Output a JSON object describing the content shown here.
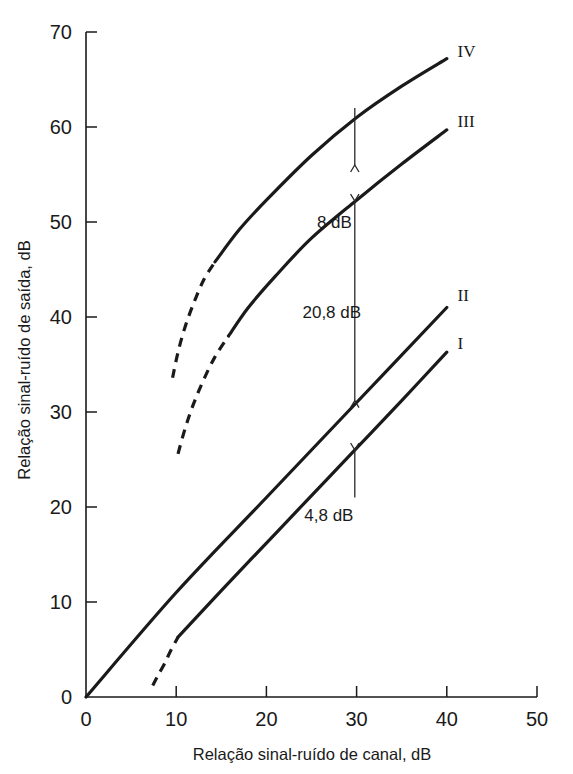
{
  "chart_data": {
    "type": "line",
    "title": "",
    "xlabel": "Relação sinal-ruído de canal, dB",
    "ylabel": "Relação sinal-ruído de saída, dB",
    "xlim": [
      0,
      50
    ],
    "ylim": [
      0,
      70
    ],
    "xticks": [
      0,
      10,
      20,
      30,
      40,
      50
    ],
    "yticks": [
      0,
      10,
      20,
      30,
      40,
      50,
      60,
      70
    ],
    "xtick_labels": [
      "0",
      "10",
      "20",
      "30",
      "40",
      "50"
    ],
    "ytick_labels": [
      "0",
      "10",
      "20",
      "30",
      "40",
      "50",
      "60",
      "70"
    ],
    "grid": false,
    "legend": "curve-end labels",
    "series": [
      {
        "name": "I",
        "label": "I",
        "label_x": 41.2,
        "label_y": 37.3,
        "solid_points": [
          [
            10.2,
            6.3
          ],
          [
            15.0,
            11.2
          ],
          [
            20.0,
            16.2
          ],
          [
            25.0,
            21.2
          ],
          [
            30.0,
            26.2
          ],
          [
            35.0,
            31.2
          ],
          [
            40.0,
            36.3
          ]
        ],
        "dashed_points": [
          [
            7.4,
            1.2
          ],
          [
            8.0,
            2.3
          ],
          [
            8.7,
            3.5
          ],
          [
            9.4,
            4.9
          ],
          [
            10.2,
            6.3
          ]
        ]
      },
      {
        "name": "II",
        "label": "II",
        "label_x": 41.2,
        "label_y": 42.3,
        "solid_points": [
          [
            0.0,
            0.0
          ],
          [
            10.0,
            11.0
          ],
          [
            20.0,
            21.0
          ],
          [
            30.0,
            31.0
          ],
          [
            40.0,
            41.0
          ]
        ],
        "dashed_points": []
      },
      {
        "name": "III",
        "label": "III",
        "label_x": 41.2,
        "label_y": 60.6,
        "solid_points": [
          [
            15.8,
            38.0
          ],
          [
            18.0,
            41.0
          ],
          [
            21.0,
            44.3
          ],
          [
            25.0,
            48.3
          ],
          [
            30.0,
            52.3
          ],
          [
            35.0,
            56.1
          ],
          [
            40.0,
            59.7
          ]
        ],
        "dashed_points": [
          [
            10.2,
            25.6
          ],
          [
            11.0,
            28.3
          ],
          [
            11.9,
            30.8
          ],
          [
            13.0,
            33.3
          ],
          [
            14.3,
            35.8
          ],
          [
            15.8,
            38.0
          ]
        ]
      },
      {
        "name": "IV",
        "label": "IV",
        "label_x": 41.2,
        "label_y": 68.0,
        "solid_points": [
          [
            14.3,
            45.8
          ],
          [
            17.0,
            49.2
          ],
          [
            20.0,
            52.3
          ],
          [
            25.0,
            57.0
          ],
          [
            30.0,
            61.0
          ],
          [
            35.0,
            64.3
          ],
          [
            40.0,
            67.2
          ]
        ],
        "dashed_points": [
          [
            9.6,
            33.6
          ],
          [
            10.2,
            36.3
          ],
          [
            11.0,
            39.0
          ],
          [
            12.0,
            41.6
          ],
          [
            13.1,
            44.0
          ],
          [
            14.3,
            45.8
          ]
        ]
      }
    ],
    "annotations": [
      {
        "id": "gap-8db",
        "text": "8 dB",
        "arrow": "down",
        "x": 29.8,
        "text_x": 25.6,
        "text_y": 50.0,
        "y_from": 62.0,
        "y_to": 56.0
      },
      {
        "id": "gap-208db",
        "text": "20,8 dB",
        "arrow": "double",
        "x": 29.8,
        "text_x": 24.0,
        "text_y": 40.5,
        "y_from": 52.2,
        "y_to": 31.2
      },
      {
        "id": "gap-48db",
        "text": "4,8 dB",
        "arrow": "up",
        "x": 29.8,
        "text_x": 24.2,
        "text_y": 19.2,
        "y_from": 21.0,
        "y_to": 26.0
      }
    ]
  },
  "axes": {
    "x_title": "Relação sinal-ruído de canal, dB",
    "y_title": "Relação sinal-ruído de saída, dB"
  }
}
